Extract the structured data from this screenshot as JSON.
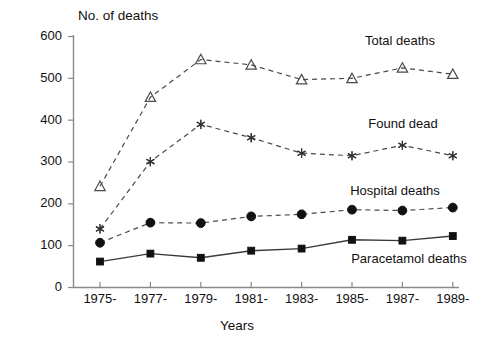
{
  "chart_data": {
    "type": "line",
    "title": "No. of deaths",
    "xlabel": "Years",
    "ylabel": "",
    "categories": [
      "1975-",
      "1977-",
      "1979-",
      "1981-",
      "1983-",
      "1985-",
      "1987-",
      "1989-"
    ],
    "ylim": [
      0,
      600
    ],
    "yticks": [
      0,
      100,
      200,
      300,
      400,
      500,
      600
    ],
    "ytick_labels": [
      "0",
      "100",
      "200",
      "300",
      "400",
      "500",
      "600"
    ],
    "grid": false,
    "legend_position": "inline-right",
    "series": [
      {
        "name": "Total deaths",
        "marker": "open-triangle",
        "linestyle": "dashed",
        "values": [
          242,
          455,
          545,
          532,
          497,
          500,
          525,
          510
        ]
      },
      {
        "name": "Found dead",
        "marker": "star",
        "linestyle": "dashed",
        "values": [
          140,
          301,
          390,
          358,
          321,
          315,
          340,
          315
        ]
      },
      {
        "name": "Hospital deaths",
        "marker": "filled-circle",
        "linestyle": "dashed",
        "values": [
          107,
          155,
          154,
          170,
          175,
          186,
          184,
          191
        ]
      },
      {
        "name": "Paracetamol deaths",
        "marker": "filled-square",
        "linestyle": "solid",
        "values": [
          62,
          81,
          71,
          88,
          93,
          114,
          112,
          123
        ]
      }
    ],
    "annotations": [
      {
        "text": "Total deaths",
        "x": 400,
        "y": 45
      },
      {
        "text": "Found dead",
        "x": 403,
        "y": 128
      },
      {
        "text": "Hospital deaths",
        "x": 395,
        "y": 195
      },
      {
        "text": "Paracetamol deaths",
        "x": 409,
        "y": 263
      }
    ]
  }
}
